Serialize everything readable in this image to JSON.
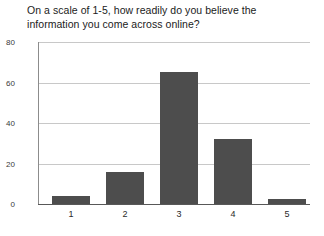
{
  "chart_data": {
    "type": "bar",
    "title": "On a scale of 1-5, how readily do you believe the information you come across online?",
    "title_line_1": "On a scale of 1-5, how readily do you believe the",
    "title_line_2": "information you come across online?",
    "categories": [
      "1",
      "2",
      "3",
      "4",
      "5"
    ],
    "values": [
      4,
      16,
      65,
      32,
      2.5
    ],
    "series": [
      {
        "name": "Responses",
        "values": [
          4,
          16,
          65,
          32,
          2.5
        ]
      }
    ],
    "xlabel": "",
    "ylabel": "",
    "ylim": [
      0,
      80
    ],
    "y_ticks": [
      0,
      20,
      40,
      60,
      80
    ],
    "y_tick_labels": [
      "0",
      "20",
      "40",
      "60",
      "80"
    ],
    "grid": true,
    "grid_axis": "y",
    "legend": false,
    "legend_position": "none",
    "bar_color": "#4d4d4d",
    "gridline_color": "#c8c8c8",
    "background_color": "#ffffff",
    "text_color": "#1b1b1b"
  }
}
